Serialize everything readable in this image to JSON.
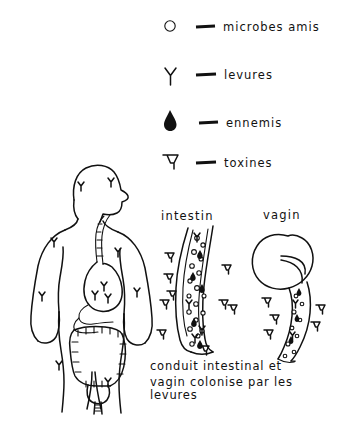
{
  "document": {
    "title": "conduit intestinal et vagin colonise par les levures",
    "language": "fr",
    "background_color": "#ffffff",
    "ink_color": "#111111",
    "style": "hand-drawn line illustration"
  },
  "legend": {
    "name": "legend",
    "entries": [
      {
        "icon": "circle-icon",
        "symbol": "O",
        "dash": "—",
        "label": "microbes amis"
      },
      {
        "icon": "y-fork-icon",
        "symbol": "Y",
        "dash": "—",
        "label": "levures"
      },
      {
        "icon": "teardrop-icon",
        "symbol": "❧",
        "dash": "—",
        "label": "ennemis"
      },
      {
        "icon": "tack-t-icon",
        "symbol": "T",
        "dash": "—",
        "label": "toxines"
      }
    ]
  },
  "figures": {
    "body": {
      "name": "human-body-figure",
      "description": "front view human torso with head in profile, digestive tract visible",
      "organs": [
        "esophagus",
        "stomach",
        "small intestine",
        "colon",
        "uterus",
        "vagina"
      ],
      "markers": "levures"
    },
    "intestine": {
      "name": "intestine-cross-section",
      "label": "intestin"
    },
    "vagina": {
      "name": "vagina-cross-section",
      "label": "vagin"
    }
  },
  "caption": {
    "name": "caption",
    "lines": [
      "conduit intestinal et",
      "vagin colonise par les",
      "levures"
    ]
  }
}
